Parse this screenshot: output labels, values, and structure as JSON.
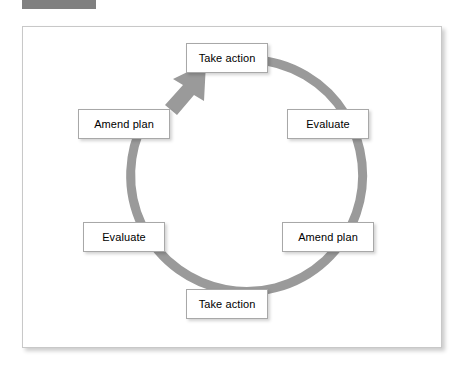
{
  "header": {
    "redacted_bar": ""
  },
  "figure": {
    "title": "",
    "diagram": {
      "type": "cycle",
      "ring_color": "#9a9a9a",
      "box_border_color": "#a8a8a8",
      "box_fill_color": "#ffffff",
      "direction": "clockwise",
      "arrowhead_position": "top-left",
      "nodes": [
        {
          "id": "take-action-top",
          "label": "Take action",
          "position": "top"
        },
        {
          "id": "evaluate-right",
          "label": "Evaluate",
          "position": "right-upper"
        },
        {
          "id": "amend-plan-right",
          "label": "Amend plan",
          "position": "right-lower"
        },
        {
          "id": "take-action-bottom",
          "label": "Take action",
          "position": "bottom"
        },
        {
          "id": "evaluate-left",
          "label": "Evaluate",
          "position": "left-lower"
        },
        {
          "id": "amend-plan-left",
          "label": "Amend plan",
          "position": "left-upper"
        }
      ]
    }
  }
}
